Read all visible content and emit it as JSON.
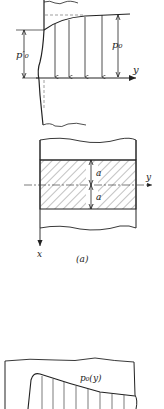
{
  "figure": {
    "top_diagram": {
      "labels": {
        "p0_prime": "p′₀",
        "p0": "p₀",
        "y_axis": "y"
      }
    },
    "middle_diagram": {
      "labels": {
        "a_upper": "a",
        "a_lower": "a",
        "y_axis": "y",
        "x_axis": "x"
      },
      "caption": "(a)"
    },
    "bottom_diagram": {
      "labels": {
        "p0_y": "p₀(y)"
      }
    }
  },
  "colors": {
    "line": "#222222",
    "dashed": "#777777",
    "hatch": "#555555",
    "background": "#ffffff"
  }
}
